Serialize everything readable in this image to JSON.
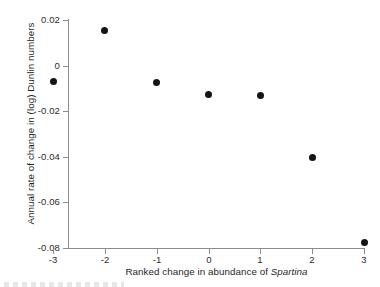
{
  "chart_data": {
    "type": "scatter",
    "title": "",
    "xlabel": "Ranked change in abundance of Spartina",
    "xlabel_plain": "Ranked change in abundance of ",
    "xlabel_italic": "Spartina",
    "ylabel": "Annual rate of change in (log) Dunlin numbers",
    "x": [
      -3,
      -2,
      -1,
      0,
      1,
      2,
      3
    ],
    "values": [
      -0.007,
      0.0155,
      -0.0075,
      -0.0125,
      -0.013,
      -0.0405,
      -0.0775
    ],
    "points": [
      {
        "x": -3,
        "y": -0.007
      },
      {
        "x": -2,
        "y": 0.0155
      },
      {
        "x": -1,
        "y": -0.0075
      },
      {
        "x": 0,
        "y": -0.0125
      },
      {
        "x": 1,
        "y": -0.013
      },
      {
        "x": 2,
        "y": -0.0405
      },
      {
        "x": 3,
        "y": -0.0775
      }
    ],
    "xlim": [
      -3,
      3
    ],
    "ylim": [
      -0.08,
      0.02
    ],
    "xticks": [
      -3,
      -2,
      -1,
      0,
      1,
      2,
      3
    ],
    "xtick_labels": [
      "-3",
      "-2",
      "-1",
      "0",
      "1",
      "2",
      "3"
    ],
    "yticks": [
      0.02,
      0,
      -0.02,
      -0.04,
      -0.06,
      -0.08
    ],
    "ytick_labels": [
      "0.02",
      "0",
      "-0.02",
      "-0.04",
      "-0.06",
      "-0.08"
    ],
    "grid": false,
    "legend": null,
    "marker": "filled-circle",
    "marker_color": "#141414",
    "axis_color": "#8c8c8c"
  }
}
